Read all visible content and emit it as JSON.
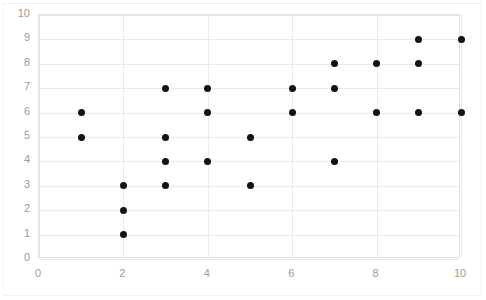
{
  "chart_data": {
    "type": "scatter",
    "title": "",
    "xlabel": "",
    "ylabel": "",
    "xlim": [
      0,
      10
    ],
    "ylim": [
      0,
      10
    ],
    "x_ticks": [
      0,
      2,
      4,
      6,
      8,
      10
    ],
    "y_ticks": [
      0,
      1,
      2,
      3,
      4,
      5,
      6,
      7,
      8,
      9,
      10
    ],
    "x_tick_labels": [
      "0",
      "2",
      "4",
      "6",
      "8",
      "10"
    ],
    "y_tick_labels": [
      "0",
      "1",
      "2",
      "3",
      "4",
      "5",
      "6",
      "7",
      "8",
      "9",
      "10"
    ],
    "grid": true,
    "legend": false,
    "marker_color": "#121212",
    "gridline_color": "#eaeaea",
    "axis_label_color": "#9a9a9a",
    "points": [
      {
        "x": 1,
        "y": 6
      },
      {
        "x": 1,
        "y": 5
      },
      {
        "x": 2,
        "y": 3
      },
      {
        "x": 2,
        "y": 2
      },
      {
        "x": 2,
        "y": 1
      },
      {
        "x": 3,
        "y": 7
      },
      {
        "x": 3,
        "y": 5
      },
      {
        "x": 3,
        "y": 4
      },
      {
        "x": 3,
        "y": 3
      },
      {
        "x": 4,
        "y": 7
      },
      {
        "x": 4,
        "y": 6
      },
      {
        "x": 4,
        "y": 4
      },
      {
        "x": 5,
        "y": 5
      },
      {
        "x": 5,
        "y": 3
      },
      {
        "x": 6,
        "y": 7
      },
      {
        "x": 6,
        "y": 6
      },
      {
        "x": 7,
        "y": 8
      },
      {
        "x": 7,
        "y": 7
      },
      {
        "x": 7,
        "y": 4
      },
      {
        "x": 8,
        "y": 8
      },
      {
        "x": 8,
        "y": 6
      },
      {
        "x": 9,
        "y": 9
      },
      {
        "x": 9,
        "y": 8
      },
      {
        "x": 9,
        "y": 6
      },
      {
        "x": 10,
        "y": 9
      },
      {
        "x": 10,
        "y": 6
      }
    ]
  }
}
